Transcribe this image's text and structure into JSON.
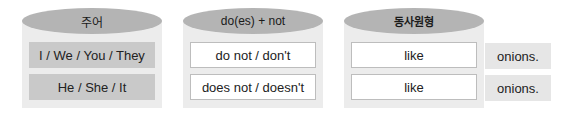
{
  "columns": [
    {
      "header": "주어",
      "rows": [
        "I / We / You / They",
        "He / She / It"
      ]
    },
    {
      "header": "do(es) + not",
      "rows": [
        "do not / don't",
        "does not / doesn't"
      ]
    },
    {
      "header": "동사원형",
      "rows": [
        "like",
        "like"
      ]
    }
  ],
  "objects": [
    "onions.",
    "onions."
  ],
  "colors": {
    "cap": "#b4b4b4",
    "cylinder_body": "#ececec",
    "subject_box": "#c9c9c9",
    "white_box_border": "#bdbdbd",
    "object_box": "#e6e6e6"
  }
}
